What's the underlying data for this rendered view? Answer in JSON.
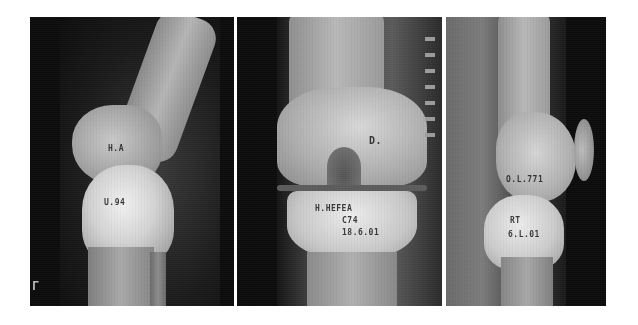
{
  "figure": {
    "panel_count": 3,
    "background": "#ffffff",
    "panels": [
      {
        "view": "lateral knee radiograph",
        "labels": {
          "upper": "H.A",
          "lower": "U.94",
          "corner_mark": "Γ"
        }
      },
      {
        "view": "anteroposterior knee radiograph",
        "labels": {
          "upper": "D.",
          "line1": "H.HEFEA",
          "line2": "C74",
          "line3": "18.6.01"
        }
      },
      {
        "view": "lateral knee radiograph",
        "labels": {
          "upper": "O.L.771",
          "line1": "RT",
          "line2": "6.L.01"
        }
      }
    ]
  }
}
